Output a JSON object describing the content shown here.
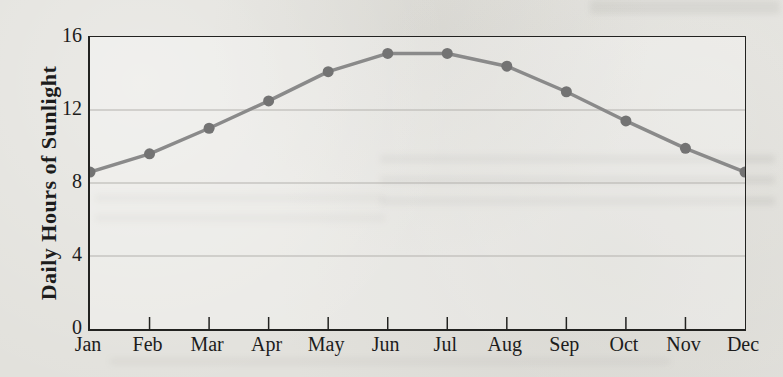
{
  "chart_data": {
    "type": "line",
    "title": "",
    "xlabel": "",
    "ylabel": "Daily Hours of Sunlight",
    "categories": [
      "Jan",
      "Feb",
      "Mar",
      "Apr",
      "May",
      "Jun",
      "Jul",
      "Aug",
      "Sep",
      "Oct",
      "Nov",
      "Dec"
    ],
    "series": [
      {
        "name": "Daily Hours of Sunlight",
        "values": [
          8.6,
          9.6,
          11.0,
          12.5,
          14.1,
          15.1,
          15.1,
          14.4,
          13.0,
          11.4,
          9.9,
          8.6
        ]
      }
    ],
    "ylim": [
      0,
      16
    ],
    "yticks": [
      0,
      4,
      8,
      12,
      16
    ],
    "gridline_values": [
      4,
      8,
      12
    ],
    "grid": "horizontal-only",
    "legend_position": "none",
    "marker": "circle",
    "colors": {
      "line": "#8a8a8a",
      "marker": "#737373",
      "gridline": "#b3b2ae",
      "axis": "#222220",
      "text": "#1c1c1c",
      "paper": "#e2e1dc"
    }
  }
}
